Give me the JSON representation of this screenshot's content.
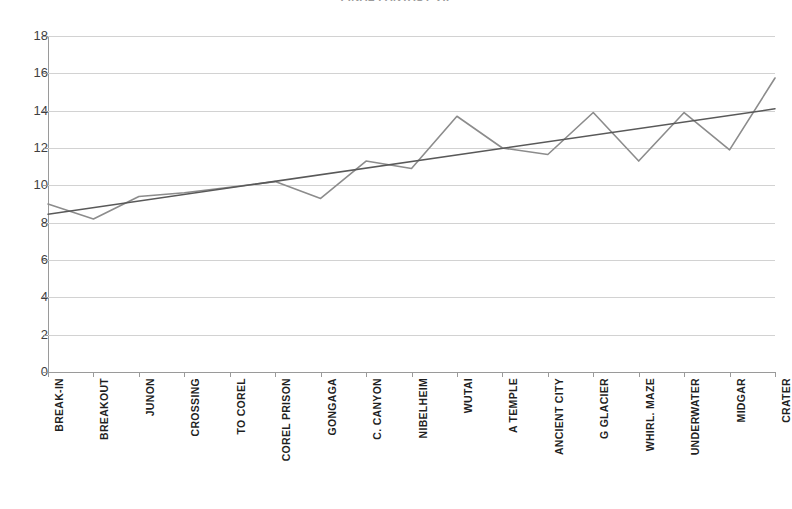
{
  "chart_data": {
    "type": "line",
    "title": "FINAL FANTASY VII",
    "xlabel": "",
    "ylabel": "",
    "ylim": [
      0,
      18
    ],
    "ytick_step": 2,
    "yticks": [
      0,
      2,
      4,
      6,
      8,
      10,
      12,
      14,
      16,
      18
    ],
    "grid": true,
    "legend": "none",
    "categories": [
      "BREAK-IN",
      "BREAKOUT",
      "JUNON",
      "CROSSING",
      "TO COREL",
      "COREL PRISON",
      "GONGAGA",
      "C. CANYON",
      "NIBELHEIM",
      "WUTAI",
      "A TEMPLE",
      "ANCIENT CITY",
      "G GLACIER",
      "WHIRL. MAZE",
      "UNDERWATER",
      "MIDGAR",
      "CRATER"
    ],
    "series": [
      {
        "name": "Level",
        "kind": "line",
        "color": "#8c8c8c",
        "values": [
          9.0,
          8.2,
          9.4,
          9.6,
          9.9,
          10.2,
          9.3,
          11.3,
          10.9,
          13.7,
          12.0,
          11.65,
          13.9,
          11.3,
          13.9,
          11.9,
          15.75
        ]
      },
      {
        "name": "Linear trendline",
        "kind": "trendline",
        "color": "#595959",
        "endpoints": [
          8.45,
          14.1
        ]
      }
    ]
  },
  "axes": {
    "y_tick_labels": [
      "18",
      "16",
      "14",
      "12",
      "10",
      "8",
      "6",
      "4",
      "2",
      "0"
    ]
  }
}
